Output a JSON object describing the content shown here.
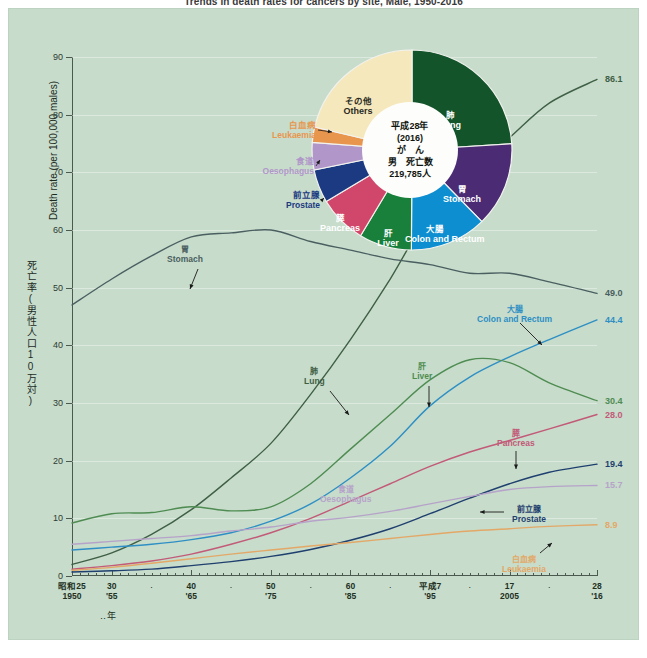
{
  "title": "Trends in death rates for cancers by site, Male, 1950-2016",
  "axes": {
    "y_label_jp": "死亡率(男性人口10万対)",
    "y_label_en": "Death rate (per 100,000 males)",
    "y_ticks": [
      "0",
      "10",
      "20",
      "30",
      "40",
      "50",
      "60",
      "70",
      "80",
      "90"
    ],
    "x_label_jp": "年",
    "x_major": [
      {
        "l1": "昭和25",
        "l2": "1950",
        "year": 1950
      },
      {
        "l1": "30",
        "l2": "'55",
        "year": 1955
      },
      {
        "l1": "40",
        "l2": "'65",
        "year": 1965
      },
      {
        "l1": "50",
        "l2": "'75",
        "year": 1975
      },
      {
        "l1": "60",
        "l2": "'85",
        "year": 1985
      },
      {
        "l1": "平成7",
        "l2": "'95",
        "year": 1995
      },
      {
        "l1": "17",
        "l2": "2005",
        "year": 2005
      },
      {
        "l1": "28",
        "l2": "'16",
        "year": 2016
      }
    ],
    "x_dots": [
      1960,
      1970,
      1980,
      1990,
      2000,
      2010
    ]
  },
  "pie": {
    "center": [
      "平成28年",
      "(2016)",
      "が　ん",
      "男　死亡数",
      "219,785人"
    ],
    "slices": [
      {
        "name": "肺 Lung",
        "jp": "肺",
        "en": "Lung",
        "value": 24.0,
        "color": "#13542a"
      },
      {
        "name": "胃 Stomach",
        "jp": "胃",
        "en": "Stomach",
        "value": 13.7,
        "color": "#4b2b74"
      },
      {
        "name": "大腸 Colon",
        "jp": "大腸",
        "en": "Colon and Rectum",
        "value": 12.4,
        "color": "#0d8ed0"
      },
      {
        "name": "肝 Liver",
        "jp": "肝",
        "en": "Liver",
        "value": 8.5,
        "color": "#19803c"
      },
      {
        "name": "膵 Pancreas",
        "jp": "膵",
        "en": "Pancreas",
        "value": 7.8,
        "color": "#d1476b"
      },
      {
        "name": "前立腺 Prostate",
        "jp": "前立腺",
        "en": "Prostate",
        "value": 5.4,
        "color": "#1b3a82"
      },
      {
        "name": "食道 Oesophagus",
        "jp": "食道",
        "en": "Oesophagus",
        "value": 4.4,
        "color": "#b197c9"
      },
      {
        "name": "白血病 Leukaemia",
        "jp": "白血病",
        "en": "Leukaemia",
        "value": 2.5,
        "color": "#e8964e"
      },
      {
        "name": "その他 Others",
        "jp": "その他",
        "en": "Others",
        "value": 21.3,
        "color": "#f6e8bd"
      }
    ]
  },
  "chart_data": {
    "type": "line",
    "title": "Trends in death rates for cancers by site, Male, 1950-2016",
    "xlabel": "年 / Year",
    "ylabel": "死亡率(男性人口10万対) / Death rate (per 100,000 males)",
    "xlim": [
      1950,
      2016
    ],
    "ylim": [
      0,
      90
    ],
    "grid": true,
    "legend": "inline-annotations",
    "x": [
      1950,
      1955,
      1960,
      1965,
      1970,
      1975,
      1980,
      1985,
      1990,
      1995,
      2000,
      2005,
      2010,
      2016
    ],
    "series": [
      {
        "name": "肺 Lung",
        "color": "#3f5f46",
        "end_label": "86.1",
        "label_jp": "肺",
        "label_en": "Lung",
        "values": [
          2.0,
          4.0,
          7.2,
          11.5,
          17.0,
          23.0,
          31.5,
          41.0,
          51.5,
          63.0,
          70.0,
          76.0,
          82.0,
          86.1
        ]
      },
      {
        "name": "胃 Stomach",
        "color": "#4a5f60",
        "end_label": "49.0",
        "label_jp": "胃",
        "label_en": "Stomach",
        "values": [
          47.0,
          51.5,
          55.5,
          58.8,
          59.5,
          60.0,
          58.0,
          56.5,
          55.0,
          54.0,
          52.5,
          52.5,
          51.0,
          49.0
        ]
      },
      {
        "name": "大腸 Colon and Rectum",
        "color": "#2e8fc4",
        "end_label": "44.4",
        "label_jp": "大腸",
        "label_en": "Colon and Rectum",
        "values": [
          4.5,
          5.0,
          5.5,
          6.3,
          7.5,
          9.5,
          12.5,
          17.0,
          22.5,
          29.5,
          34.5,
          38.0,
          41.0,
          44.4
        ]
      },
      {
        "name": "肝 Liver",
        "color": "#4f8c52",
        "end_label": "30.4",
        "label_jp": "肝",
        "label_en": "Liver",
        "values": [
          9.2,
          10.8,
          11.0,
          12.0,
          11.3,
          12.0,
          16.0,
          22.0,
          28.0,
          34.0,
          37.5,
          37.0,
          33.5,
          30.4
        ]
      },
      {
        "name": "膵 Pancreas",
        "color": "#c25a78",
        "end_label": "28.0",
        "label_jp": "膵",
        "label_en": "Pancreas",
        "values": [
          1.2,
          1.8,
          2.6,
          3.8,
          5.5,
          7.5,
          10.0,
          13.0,
          16.0,
          19.0,
          21.5,
          23.5,
          25.5,
          28.0
        ]
      },
      {
        "name": "前立腺 Prostate",
        "color": "#1f3f6e",
        "end_label": "19.4",
        "label_jp": "前立腺",
        "label_en": "Prostate",
        "values": [
          0.7,
          0.9,
          1.2,
          1.8,
          2.5,
          3.4,
          4.6,
          6.2,
          8.2,
          10.8,
          13.5,
          16.0,
          18.0,
          19.4
        ]
      },
      {
        "name": "食道 Oesophagus",
        "color": "#b6a3c9",
        "end_label": "15.7",
        "label_jp": "食道",
        "label_en": "Oesophagus",
        "values": [
          5.5,
          6.0,
          6.5,
          7.0,
          7.8,
          8.5,
          9.5,
          10.2,
          11.2,
          12.5,
          13.8,
          15.0,
          15.5,
          15.7
        ]
      },
      {
        "name": "白血病 Leukaemia",
        "color": "#e3a867",
        "end_label": "8.9",
        "label_jp": "白血病",
        "label_en": "Leukaemia",
        "values": [
          1.0,
          1.5,
          2.2,
          3.0,
          3.8,
          4.5,
          5.2,
          5.8,
          6.5,
          7.2,
          7.8,
          8.2,
          8.6,
          8.9
        ]
      }
    ]
  }
}
